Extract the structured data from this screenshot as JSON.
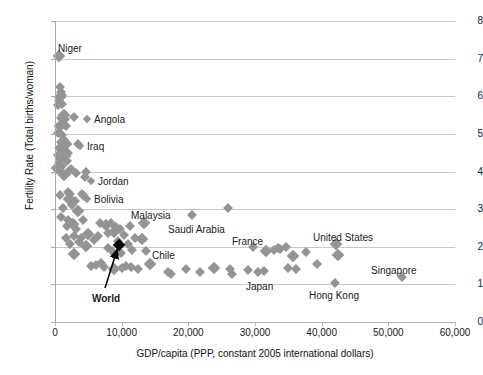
{
  "chart_data": {
    "type": "scatter",
    "title": "",
    "xlabel": "GDP/capita (PPP, constant 2005 international dollars)",
    "ylabel": "Fertility Rate (Total births/woman)",
    "xlim": [
      0,
      60000
    ],
    "ylim": [
      0,
      8
    ],
    "xticks": [
      0,
      10000,
      20000,
      30000,
      40000,
      50000,
      60000
    ],
    "xticklabels": [
      "0",
      "10,000",
      "20,000",
      "30,000",
      "40,000",
      "50,000",
      "60,000"
    ],
    "yticks": [
      0,
      1,
      2,
      3,
      4,
      5,
      6,
      7,
      8
    ],
    "yticklabels": [
      "0",
      "1",
      "2",
      "3",
      "4",
      "5",
      "6",
      "7",
      "8"
    ],
    "grid": "horizontal",
    "legend": "none",
    "marker": "diamond",
    "marker_color": "#949494",
    "highlight_color": "#0a0a0a",
    "gridline_color": "#c8c8c8",
    "annotations": [
      {
        "name": "Niger",
        "text": "Niger",
        "lx": 58,
        "ly": 44,
        "bold": false,
        "swatch": false
      },
      {
        "name": "Angola",
        "text": "Angola",
        "lx": 84,
        "ly": 115,
        "bold": false,
        "swatch": true
      },
      {
        "name": "Iraq",
        "text": "Iraq",
        "lx": 77,
        "ly": 142,
        "bold": false,
        "swatch": true
      },
      {
        "name": "Jordan",
        "text": "Jordan",
        "lx": 88,
        "ly": 177,
        "bold": false,
        "swatch": true
      },
      {
        "name": "Bolivia",
        "text": "Bolivia",
        "lx": 84,
        "ly": 195,
        "bold": false,
        "swatch": true
      },
      {
        "name": "Malaysia",
        "text": "Malaysia",
        "lx": 131,
        "ly": 211,
        "bold": false,
        "swatch": false
      },
      {
        "name": "Saudi Arabia",
        "text": "Saudi Arabia",
        "lx": 168,
        "ly": 225,
        "bold": false,
        "swatch": false
      },
      {
        "name": "Chile",
        "text": "Chile",
        "lx": 152,
        "ly": 251,
        "bold": false,
        "swatch": false
      },
      {
        "name": "France",
        "text": "France",
        "lx": 232,
        "ly": 237,
        "bold": false,
        "swatch": false
      },
      {
        "name": "Japan",
        "text": "Japan",
        "lx": 246,
        "ly": 282,
        "bold": false,
        "swatch": false
      },
      {
        "name": "United States",
        "text": "United States",
        "lx": 313,
        "ly": 233,
        "bold": false,
        "swatch": false
      },
      {
        "name": "Hong Kong",
        "text": "Hong Kong",
        "lx": 309,
        "ly": 291,
        "bold": false,
        "swatch": false
      },
      {
        "name": "Singapore",
        "text": "Singapore",
        "lx": 371,
        "ly": 266,
        "bold": false,
        "swatch": false
      },
      {
        "name": "World",
        "text": "World",
        "lx": 92,
        "ly": 294,
        "bold": true,
        "swatch": false
      }
    ],
    "highlight_points": [
      {
        "name": "World",
        "x": 9600,
        "y": 2.05
      }
    ],
    "points": [
      {
        "x": 650,
        "y": 7.07,
        "name": "Niger"
      },
      {
        "x": 2900,
        "y": 5.45,
        "name": "Angola"
      },
      {
        "x": 3400,
        "y": 4.72,
        "name": "Iraq"
      },
      {
        "x": 4500,
        "y": 3.85,
        "name": "Jordan"
      },
      {
        "x": 4100,
        "y": 3.4,
        "name": "Bolivia"
      },
      {
        "x": 13400,
        "y": 2.64,
        "name": "Malaysia"
      },
      {
        "x": 20500,
        "y": 2.84,
        "name": "Saudi Arabia"
      },
      {
        "x": 13600,
        "y": 1.89,
        "name": "Chile"
      },
      {
        "x": 29700,
        "y": 1.99,
        "name": "France"
      },
      {
        "x": 30400,
        "y": 1.33,
        "name": "Japan"
      },
      {
        "x": 42200,
        "y": 2.07,
        "name": "United States"
      },
      {
        "x": 42000,
        "y": 1.04,
        "name": "Hong Kong"
      },
      {
        "x": 52000,
        "y": 1.2,
        "name": "Singapore"
      },
      {
        "x": 700,
        "y": 6.24
      },
      {
        "x": 900,
        "y": 6.1
      },
      {
        "x": 780,
        "y": 5.98
      },
      {
        "x": 600,
        "y": 5.88
      },
      {
        "x": 1100,
        "y": 6.02
      },
      {
        "x": 1000,
        "y": 5.8
      },
      {
        "x": 480,
        "y": 5.76
      },
      {
        "x": 1300,
        "y": 5.5
      },
      {
        "x": 900,
        "y": 5.42
      },
      {
        "x": 1500,
        "y": 5.4
      },
      {
        "x": 1150,
        "y": 5.3
      },
      {
        "x": 1700,
        "y": 5.22
      },
      {
        "x": 700,
        "y": 5.2
      },
      {
        "x": 500,
        "y": 5.02
      },
      {
        "x": 1000,
        "y": 4.98
      },
      {
        "x": 1400,
        "y": 4.84
      },
      {
        "x": 900,
        "y": 4.78
      },
      {
        "x": 1600,
        "y": 4.72
      },
      {
        "x": 600,
        "y": 4.62
      },
      {
        "x": 1200,
        "y": 4.58
      },
      {
        "x": 2000,
        "y": 4.5
      },
      {
        "x": 450,
        "y": 4.44
      },
      {
        "x": 1500,
        "y": 4.4
      },
      {
        "x": 800,
        "y": 4.32
      },
      {
        "x": 1800,
        "y": 4.28
      },
      {
        "x": 600,
        "y": 4.22
      },
      {
        "x": 1100,
        "y": 4.14
      },
      {
        "x": 350,
        "y": 4.1
      },
      {
        "x": 2400,
        "y": 4.06
      },
      {
        "x": 1900,
        "y": 3.98
      },
      {
        "x": 3100,
        "y": 3.96
      },
      {
        "x": 700,
        "y": 4.02
      },
      {
        "x": 1300,
        "y": 3.9
      },
      {
        "x": 4600,
        "y": 3.98
      },
      {
        "x": 800,
        "y": 3.38
      },
      {
        "x": 1900,
        "y": 3.46
      },
      {
        "x": 2300,
        "y": 3.4
      },
      {
        "x": 2100,
        "y": 3.28
      },
      {
        "x": 3000,
        "y": 3.22
      },
      {
        "x": 2600,
        "y": 3.12
      },
      {
        "x": 4300,
        "y": 3.34
      },
      {
        "x": 1200,
        "y": 3.02
      },
      {
        "x": 3500,
        "y": 2.96
      },
      {
        "x": 25900,
        "y": 3.03
      },
      {
        "x": 900,
        "y": 2.78
      },
      {
        "x": 2000,
        "y": 2.72
      },
      {
        "x": 2400,
        "y": 2.64
      },
      {
        "x": 2700,
        "y": 2.6
      },
      {
        "x": 1800,
        "y": 2.56
      },
      {
        "x": 4200,
        "y": 2.72
      },
      {
        "x": 3200,
        "y": 2.48
      },
      {
        "x": 6800,
        "y": 2.64
      },
      {
        "x": 7600,
        "y": 2.58
      },
      {
        "x": 8400,
        "y": 2.62
      },
      {
        "x": 9100,
        "y": 2.52
      },
      {
        "x": 9800,
        "y": 2.46
      },
      {
        "x": 11200,
        "y": 2.54
      },
      {
        "x": 8800,
        "y": 2.4
      },
      {
        "x": 7900,
        "y": 2.36
      },
      {
        "x": 1600,
        "y": 2.24
      },
      {
        "x": 2900,
        "y": 2.28
      },
      {
        "x": 3900,
        "y": 2.22
      },
      {
        "x": 5000,
        "y": 2.34
      },
      {
        "x": 5800,
        "y": 2.18
      },
      {
        "x": 6400,
        "y": 2.28
      },
      {
        "x": 10400,
        "y": 2.32
      },
      {
        "x": 12000,
        "y": 2.22
      },
      {
        "x": 13000,
        "y": 2.2
      },
      {
        "x": 9400,
        "y": 2.16
      },
      {
        "x": 10900,
        "y": 2.08
      },
      {
        "x": 3600,
        "y": 2.12
      },
      {
        "x": 2200,
        "y": 2.06
      },
      {
        "x": 4700,
        "y": 2.02
      },
      {
        "x": 8000,
        "y": 1.98
      },
      {
        "x": 8600,
        "y": 1.88
      },
      {
        "x": 9900,
        "y": 1.84
      },
      {
        "x": 11600,
        "y": 1.92
      },
      {
        "x": 2800,
        "y": 1.82
      },
      {
        "x": 5400,
        "y": 1.48
      },
      {
        "x": 6100,
        "y": 1.52
      },
      {
        "x": 6900,
        "y": 1.58
      },
      {
        "x": 7400,
        "y": 1.46
      },
      {
        "x": 8900,
        "y": 1.42
      },
      {
        "x": 10000,
        "y": 1.44
      },
      {
        "x": 10700,
        "y": 1.5
      },
      {
        "x": 11400,
        "y": 1.46
      },
      {
        "x": 12400,
        "y": 1.42
      },
      {
        "x": 14200,
        "y": 1.54
      },
      {
        "x": 16900,
        "y": 1.34
      },
      {
        "x": 17400,
        "y": 1.28
      },
      {
        "x": 19700,
        "y": 1.4
      },
      {
        "x": 21800,
        "y": 1.33
      },
      {
        "x": 23900,
        "y": 1.44
      },
      {
        "x": 26200,
        "y": 1.4
      },
      {
        "x": 26500,
        "y": 1.28
      },
      {
        "x": 28900,
        "y": 1.38
      },
      {
        "x": 31400,
        "y": 1.36
      },
      {
        "x": 31700,
        "y": 1.89
      },
      {
        "x": 32900,
        "y": 1.92
      },
      {
        "x": 33400,
        "y": 1.96
      },
      {
        "x": 33800,
        "y": 1.93
      },
      {
        "x": 34600,
        "y": 2.0
      },
      {
        "x": 35700,
        "y": 1.76
      },
      {
        "x": 36200,
        "y": 1.42
      },
      {
        "x": 35000,
        "y": 1.44
      },
      {
        "x": 37600,
        "y": 1.86
      },
      {
        "x": 39300,
        "y": 1.53
      },
      {
        "x": 42500,
        "y": 1.78
      }
    ]
  }
}
